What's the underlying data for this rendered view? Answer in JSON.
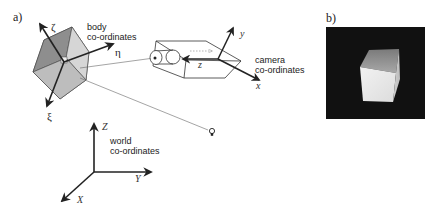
{
  "panels": {
    "a": {
      "label": "a)",
      "body": {
        "title_line1": "body",
        "title_line2": "co-ordinates",
        "axes": {
          "zeta": "ζ",
          "eta": "η",
          "xi": "ξ"
        }
      },
      "camera": {
        "title_line1": "camera",
        "title_line2": "co-ordinates",
        "axes": {
          "x": "x",
          "y": "y",
          "z": "z"
        }
      },
      "world": {
        "title_line1": "world",
        "title_line2": "co-ordinates",
        "axes": {
          "X": "X",
          "Y": "Y",
          "Z": "Z"
        }
      },
      "light_icon": "lightbulb-icon"
    },
    "b": {
      "label": "b)",
      "image_description": "rendered white cube on black background"
    }
  },
  "colors": {
    "ink": "#222222",
    "cube_dark": "#8a8a8a",
    "cube_mid": "#b5b5b5",
    "cube_light": "#d8d8d8",
    "photo_bg": "#111111"
  }
}
